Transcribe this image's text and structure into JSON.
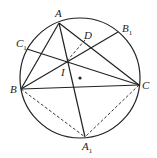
{
  "diagram": {
    "type": "geometry",
    "circle": {
      "cx": 80,
      "cy": 78,
      "r": 60
    },
    "points": {
      "A": {
        "x": 59,
        "y": 23,
        "label": "A"
      },
      "B": {
        "x": 21,
        "y": 89,
        "label": "B"
      },
      "C": {
        "x": 139,
        "y": 85,
        "label": "C"
      },
      "A1": {
        "x": 85,
        "y": 137,
        "label": "A",
        "sub": "1"
      },
      "B1": {
        "x": 118,
        "y": 32,
        "label": "B",
        "sub": "1"
      },
      "C1": {
        "x": 27,
        "y": 49,
        "label": "C",
        "sub": "1"
      },
      "D": {
        "x": 85,
        "y": 40,
        "label": "D"
      },
      "I": {
        "x": 67,
        "y": 61,
        "label": "I"
      },
      "O": {
        "x": 80,
        "y": 78
      }
    },
    "solid_segments": [
      "AB",
      "AC",
      "BC",
      "AA1",
      "BB1",
      "CC1"
    ],
    "dashed_segments": [
      "BA1",
      "CA1",
      "ID"
    ],
    "colors": {
      "stroke": "#222222",
      "background": "#ffffff"
    }
  }
}
